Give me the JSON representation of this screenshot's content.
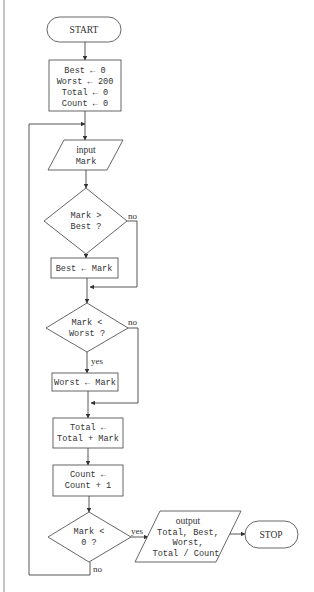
{
  "flowchart": {
    "start": {
      "label": "START"
    },
    "init": {
      "lines": [
        "Best ← 0",
        "Worst ← 200",
        "Total ← 0",
        "Count ← 0"
      ]
    },
    "input": {
      "keyword": "input",
      "variable": "Mark"
    },
    "decision_best": {
      "lines": [
        "Mark >",
        "Best ?"
      ],
      "yes_label": "yes",
      "no_label": "no"
    },
    "assign_best": {
      "text": "Best ← Mark"
    },
    "decision_worst": {
      "lines": [
        "Mark <",
        "Worst ?"
      ],
      "yes_label": "yes",
      "no_label": "no"
    },
    "assign_worst": {
      "text": "Worst ← Mark"
    },
    "update_total": {
      "lines": [
        "Total ←",
        "Total + Mark"
      ]
    },
    "update_count": {
      "lines": [
        "Count ←",
        "Count + 1"
      ]
    },
    "decision_end": {
      "lines": [
        "Mark <",
        "0 ?"
      ],
      "yes_label": "yes",
      "no_label": "no"
    },
    "output": {
      "keyword": "output",
      "lines": [
        "Total, Best,",
        "Worst,",
        "Total / Count"
      ]
    },
    "stop": {
      "label": "STOP"
    }
  },
  "colors": {
    "stroke": "#555555",
    "text": "#333333",
    "background": "#ffffff"
  }
}
